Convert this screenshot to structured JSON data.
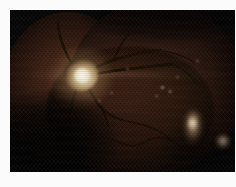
{
  "image": {
    "kind": "retinal-fundus-photograph",
    "caption": "Retinal fundus photograph",
    "width_px": "236",
    "height_px": "187",
    "frame": {
      "border_color": "#fbfbfb",
      "border_left_px": "10",
      "border_top_px": "10",
      "plate_color": "#050505"
    },
    "palette": {
      "background": "#050505",
      "retina_mid": "#30190f",
      "retina_dark": "#130905",
      "optic_disc": "#f4ecd8",
      "optic_disc_rim": "#b79c72",
      "vessel": "#160b06",
      "lesion_bright": "#ded0a6"
    },
    "features": [
      {
        "name": "optic-disc",
        "label": "Optic disc",
        "description": "Bright round disc with central cup, upper-left quadrant",
        "x": "72",
        "y": "65",
        "brightness": "high"
      },
      {
        "name": "macula",
        "label": "Macula",
        "description": "Dark avascular central region",
        "x": "132",
        "y": "82",
        "brightness": "low"
      },
      {
        "name": "vascular-arcade",
        "label": "Vascular arcade",
        "description": "Dark branching retinal vessels radiating from the optic disc",
        "x": "120",
        "y": "110",
        "brightness": "very-low"
      },
      {
        "name": "lesion-inferotemporal",
        "label": "Bright elongated lesion",
        "description": "Vertically elongated pale lesion, lower right quadrant",
        "x": "186",
        "y": "124",
        "brightness": "high"
      },
      {
        "name": "lesion-peripheral",
        "label": "Peripheral bright spot",
        "description": "Small pale spot at the temporal edge",
        "x": "213",
        "y": "131",
        "brightness": "medium"
      },
      {
        "name": "montage-seam",
        "label": "Montage seam",
        "description": "Overlap boundary of two stitched fundus fields",
        "x": "70",
        "y": "80",
        "brightness": "low"
      }
    ],
    "specks": [
      {
        "x": "160",
        "y": "86",
        "w": "5",
        "h": "3"
      },
      {
        "x": "168",
        "y": "90",
        "w": "4",
        "h": "3"
      },
      {
        "x": "155",
        "y": "95",
        "w": "3",
        "h": "2"
      },
      {
        "x": "110",
        "y": "92",
        "w": "3",
        "h": "2"
      },
      {
        "x": "98",
        "y": "100",
        "w": "3",
        "h": "2"
      },
      {
        "x": "176",
        "y": "76",
        "w": "3",
        "h": "2"
      },
      {
        "x": "196",
        "y": "60",
        "w": "3",
        "h": "2"
      },
      {
        "x": "126",
        "y": "68",
        "w": "3",
        "h": "2"
      }
    ],
    "vessels": {
      "stroke_color": "#130a06",
      "paths": [
        "M 72 66 C 66 78, 62 90, 60 104 C 58 116, 62 126, 68 134",
        "M 72 66 C 78 76, 82 86, 88 94 C 96 104, 104 108, 112 110",
        "M 72 66 C 80 60, 92 54, 104 50 C 118 45, 134 42, 150 40",
        "M 72 66 C 84 64, 96 62, 110 60 C 128 58, 146 56, 162 54",
        "M 72 66 C 64 58, 58 48, 54 38 C 50 28, 48 20, 48 12",
        "M 68 134 C 78 128, 88 126, 98 128 C 108 130, 114 136, 122 136 C 130 136, 136 130, 144 128 C 152 126, 158 128, 164 132",
        "M 88 94 C 94 100, 96 108, 98 116",
        "M 112 110 C 122 112, 132 114, 142 118 C 152 122, 160 128, 166 134",
        "M 104 50 C 108 40, 112 32, 118 24",
        "M 150 40 C 162 42, 174 46, 184 52",
        "M 162 54 C 172 58, 180 64, 186 72",
        "M 60 104 C 52 100, 46 94, 42 86",
        "M 164 132 C 172 136, 180 142, 186 150"
      ]
    }
  }
}
